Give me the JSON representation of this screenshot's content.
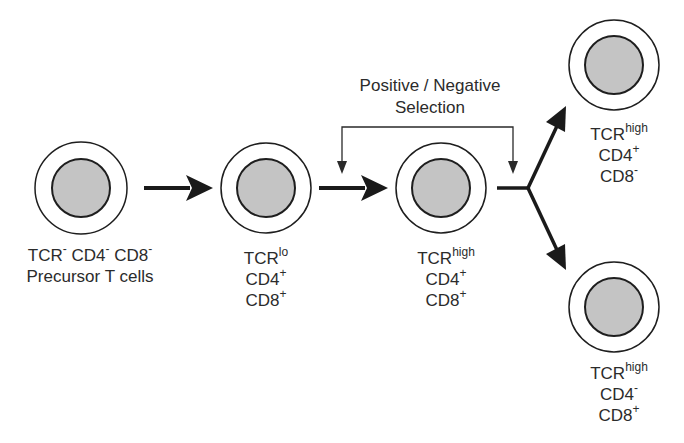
{
  "selection_label": {
    "line1": "Positive / Negative",
    "line2": "Selection"
  },
  "colors": {
    "cell_outline": "#1e1e1e",
    "nucleus_fill": "#c4c4c4",
    "arrow": "#1a1a1a",
    "text": "#2b2b2b"
  },
  "cells": [
    {
      "id": "precursor",
      "lines": [
        {
          "parts": [
            [
              "TCR",
              "-"
            ],
            [
              " CD4",
              "-"
            ],
            [
              " CD8",
              "-"
            ]
          ]
        },
        {
          "text": "Precursor T cells"
        }
      ]
    },
    {
      "id": "double-positive-lo",
      "tcr": {
        "base": "TCR",
        "sup": "lo"
      },
      "cd4": {
        "base": "CD4",
        "sup": "+"
      },
      "cd8": {
        "base": "CD8",
        "sup": "+"
      }
    },
    {
      "id": "double-positive-high",
      "tcr": {
        "base": "TCR",
        "sup": "high"
      },
      "cd4": {
        "base": "CD4",
        "sup": "+"
      },
      "cd8": {
        "base": "CD8",
        "sup": "+"
      }
    },
    {
      "id": "cd4-single-positive",
      "tcr": {
        "base": "TCR",
        "sup": "high"
      },
      "cd4": {
        "base": "CD4",
        "sup": "+"
      },
      "cd8": {
        "base": "CD8",
        "sup": "-"
      }
    },
    {
      "id": "cd8-single-positive",
      "tcr": {
        "base": "TCR",
        "sup": "high"
      },
      "cd4": {
        "base": "CD4",
        "sup": "-"
      },
      "cd8": {
        "base": "CD8",
        "sup": "+"
      }
    }
  ],
  "precursor_label": {
    "tcr": "TCR",
    "tcr_sup": "-",
    "cd4": " CD4",
    "cd4_sup": "-",
    "cd8": " CD8",
    "cd8_sup": "-",
    "line2": "Precursor T cells"
  }
}
